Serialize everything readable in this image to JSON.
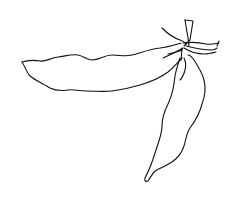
{
  "image": {
    "subject": "line drawing of two pea pods hanging from a stem",
    "width": 230,
    "height": 197,
    "background": "#ffffff",
    "stroke_color": "#111111"
  },
  "elements": [
    {
      "name": "horizontal-pea-pod",
      "description": "long wavy pod extending left"
    },
    {
      "name": "hanging-pea-pod",
      "description": "pod hanging downward to a pointed tip"
    },
    {
      "name": "stem-and-sepals",
      "description": "stem with spreading sepal strands at the top right"
    }
  ]
}
